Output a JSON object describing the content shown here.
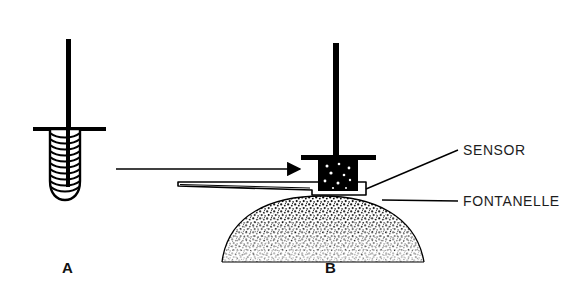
{
  "figure": {
    "background_color": "#ffffff",
    "ink_color": "#000000",
    "panels": [
      {
        "id": "A",
        "caption": "A",
        "description": "Uncompressed coil sensor probe with vertical stem and flange, shown free-standing"
      },
      {
        "id": "B",
        "caption": "B",
        "description": "Coil compressed against sensor plate resting on the fontanelle of a stippled infant skull"
      }
    ],
    "annotations": [
      {
        "name": "sensor",
        "label": "SENSOR",
        "leader": "diagonal line from sensor plate right edge up to text"
      },
      {
        "name": "fontanelle",
        "label": "FONTANELLE",
        "leader": "horizontal line from skull dome to text"
      }
    ],
    "transition_arrow": {
      "name": "transition-arrow",
      "direction": "right",
      "description": "Arrow from panel A probe toward panel B assembly"
    }
  }
}
